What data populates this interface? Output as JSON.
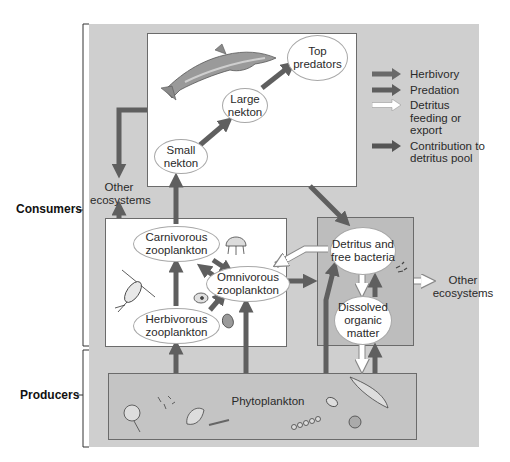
{
  "side_labels": {
    "consumers": "Consumers",
    "producers": "Producers"
  },
  "nodes": {
    "top_predators": "Top predators",
    "large_nekton": "Large nekton",
    "small_nekton": "Small nekton",
    "other_ecosystems_left": "Other ecosystems",
    "carnivorous_zooplankton": "Carnivorous zooplankton",
    "omnivorous_zooplankton": "Omnivorous zooplankton",
    "herbivorous_zooplankton": "Herbivorous zooplankton",
    "detritus_bacteria": "Detritus and free bacteria",
    "dissolved_organic_matter": "Dissolved organic matter",
    "other_ecosystems_right": "Other ecosystems",
    "phytoplankton": "Phytoplankton"
  },
  "legend": [
    {
      "label": "Herbivory",
      "color": "#6a6a6a",
      "fill": "dark"
    },
    {
      "label": "Predation",
      "color": "#5e5e5e",
      "fill": "dark"
    },
    {
      "label": "Detritus feeding or export",
      "color": "#ffffff",
      "fill": "white"
    },
    {
      "label": "Contribution to detritus pool",
      "color": "#555555",
      "fill": "dark"
    }
  ],
  "colors": {
    "background": "#cfcfcf",
    "box_white": "#ffffff",
    "box_detritus": "#bdbdbd",
    "arrow_dark": "#5f5f5f",
    "arrow_white": "#ffffff",
    "border": "#6b6b6b"
  },
  "icons": {
    "dolphin": "dolphin-icon",
    "copepod": "copepod-icon",
    "jellyfish": "jellyfish-icon",
    "ciliate": "ciliate-icon",
    "dinoflagellate": "dinoflagellate-icon",
    "bacteria": "bacteria-icon",
    "diatom": "diatom-icon"
  }
}
